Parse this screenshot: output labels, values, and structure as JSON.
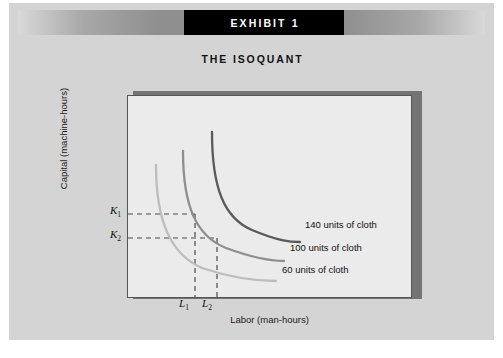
{
  "exhibit": {
    "banner_title": "EXHIBIT 1",
    "subtitle": "THE ISOQUANT"
  },
  "colors": {
    "card_background": "#d4d4d4",
    "plot_background": "#ebebeb",
    "plot_border": "#555555",
    "plot_shadow": "#747474",
    "banner_block": "#000000",
    "curve_140": "#5a5a5a",
    "curve_100": "#8e8e8e",
    "curve_60": "#bdbdbd",
    "guide_line": "#4a4a4a"
  },
  "chart_data": {
    "type": "line",
    "title": "THE ISOQUANT",
    "xlabel": "Labor (man-hours)",
    "ylabel": "Capital (machine-hours)",
    "grid": false,
    "legend_position": "right-inline",
    "axis_ticks": {
      "y": [
        "K1",
        "K2"
      ],
      "x": [
        "L1",
        "L2"
      ]
    },
    "annotations": [
      {
        "name": "K1",
        "text": "K",
        "sub": "1",
        "axis": "y"
      },
      {
        "name": "K2",
        "text": "K",
        "sub": "2",
        "axis": "y"
      },
      {
        "name": "L1",
        "text": "L",
        "sub": "1",
        "axis": "x"
      },
      {
        "name": "L2",
        "text": "L",
        "sub": "2",
        "axis": "x"
      }
    ],
    "guide_lines": [
      {
        "from": "K1",
        "to": "L1",
        "style": "dashed",
        "curve": "100 units of cloth"
      },
      {
        "from": "K2",
        "to": "L2",
        "style": "dashed",
        "curve": "100 units of cloth"
      }
    ],
    "series": [
      {
        "name": "140 units of cloth",
        "label": "140 units of cloth",
        "output_units": 140,
        "color": "#5a5a5a",
        "path": "M 84 36 C 84 92, 96 122, 124 134 C 150 145, 162 146, 172 146"
      },
      {
        "name": "100 units of cloth",
        "label": "100 units of cloth",
        "output_units": 100,
        "color": "#8e8e8e",
        "path": "M 55 55 C 55 110, 68 140, 98 152 C 128 163, 146 165, 156 165"
      },
      {
        "name": "60 units of cloth",
        "label": "60 units of cloth",
        "output_units": 60,
        "color": "#bdbdbd",
        "path": "M 28 69 C 28 124, 42 158, 74 172 C 110 184, 138 185, 148 185"
      }
    ]
  }
}
